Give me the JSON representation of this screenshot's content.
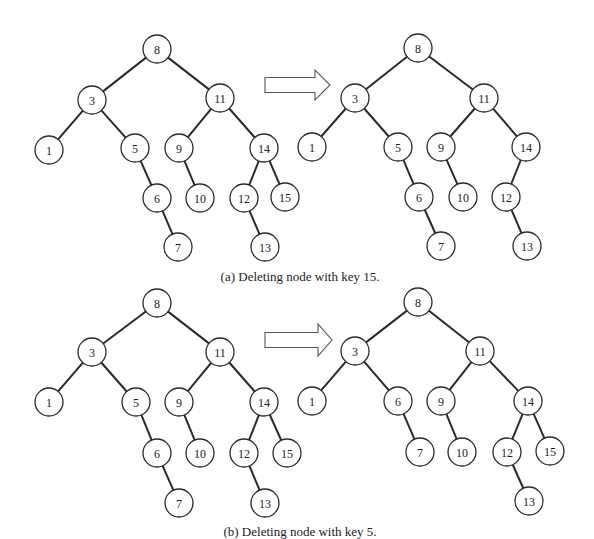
{
  "figure": {
    "node_radius": 14,
    "colors": {
      "stroke": "#2a2a2a",
      "fill": "#ffffff",
      "text": "#222222",
      "arrow_stroke": "#555555"
    },
    "panels": [
      {
        "id": "a",
        "caption": "(a) Deleting node with key 15.",
        "caption_pos": [
          300,
          278
        ],
        "deleted_key": 15,
        "arrow": {
          "x1": 265,
          "y_mid": 85,
          "shaft_half": 7.5,
          "head_start": 315,
          "head_half": 15,
          "tip": 330
        },
        "before": {
          "nodes": [
            {
              "key": "8",
              "x": 157,
              "y": 49
            },
            {
              "key": "3",
              "x": 92,
              "y": 100
            },
            {
              "key": "11",
              "x": 220,
              "y": 98
            },
            {
              "key": "1",
              "x": 49,
              "y": 150
            },
            {
              "key": "5",
              "x": 135,
              "y": 148
            },
            {
              "key": "9",
              "x": 179,
              "y": 148
            },
            {
              "key": "14",
              "x": 264,
              "y": 148
            },
            {
              "key": "6",
              "x": 157,
              "y": 198
            },
            {
              "key": "10",
              "x": 200,
              "y": 198
            },
            {
              "key": "12",
              "x": 244,
              "y": 198
            },
            {
              "key": "15",
              "x": 285,
              "y": 197
            },
            {
              "key": "7",
              "x": 178,
              "y": 247
            },
            {
              "key": "13",
              "x": 265,
              "y": 247
            }
          ],
          "edges": [
            [
              "8",
              "3"
            ],
            [
              "8",
              "11"
            ],
            [
              "3",
              "1"
            ],
            [
              "3",
              "5"
            ],
            [
              "5",
              "6"
            ],
            [
              "6",
              "7"
            ],
            [
              "11",
              "9"
            ],
            [
              "11",
              "14"
            ],
            [
              "9",
              "10"
            ],
            [
              "14",
              "12"
            ],
            [
              "14",
              "15"
            ],
            [
              "12",
              "13"
            ]
          ]
        },
        "after": {
          "nodes": [
            {
              "key": "8",
              "x": 418,
              "y": 48
            },
            {
              "key": "3",
              "x": 355,
              "y": 98
            },
            {
              "key": "11",
              "x": 484,
              "y": 98
            },
            {
              "key": "1",
              "x": 312,
              "y": 147
            },
            {
              "key": "5",
              "x": 398,
              "y": 147
            },
            {
              "key": "9",
              "x": 441,
              "y": 147
            },
            {
              "key": "14",
              "x": 526,
              "y": 147
            },
            {
              "key": "6",
              "x": 419,
              "y": 197
            },
            {
              "key": "10",
              "x": 463,
              "y": 197
            },
            {
              "key": "12",
              "x": 506,
              "y": 197
            },
            {
              "key": "7",
              "x": 441,
              "y": 246
            },
            {
              "key": "13",
              "x": 527,
              "y": 246
            }
          ],
          "edges": [
            [
              "8",
              "3"
            ],
            [
              "8",
              "11"
            ],
            [
              "3",
              "1"
            ],
            [
              "3",
              "5"
            ],
            [
              "5",
              "6"
            ],
            [
              "6",
              "7"
            ],
            [
              "11",
              "9"
            ],
            [
              "11",
              "14"
            ],
            [
              "9",
              "10"
            ],
            [
              "14",
              "12"
            ],
            [
              "12",
              "13"
            ]
          ]
        }
      },
      {
        "id": "b",
        "caption": "(b) Deleting node with key 5.",
        "caption_pos": [
          300,
          533
        ],
        "deleted_key": 5,
        "arrow": {
          "x1": 265,
          "y_mid": 340,
          "shaft_half": 7.5,
          "head_start": 318,
          "head_half": 16,
          "tip": 332
        },
        "before": {
          "nodes": [
            {
              "key": "8",
              "x": 157,
              "y": 303
            },
            {
              "key": "3",
              "x": 92,
              "y": 352
            },
            {
              "key": "11",
              "x": 220,
              "y": 352
            },
            {
              "key": "1",
              "x": 49,
              "y": 402
            },
            {
              "key": "5",
              "x": 136,
              "y": 402
            },
            {
              "key": "9",
              "x": 179,
              "y": 402
            },
            {
              "key": "14",
              "x": 264,
              "y": 402
            },
            {
              "key": "6",
              "x": 157,
              "y": 453
            },
            {
              "key": "10",
              "x": 200,
              "y": 453
            },
            {
              "key": "12",
              "x": 244,
              "y": 453
            },
            {
              "key": "15",
              "x": 287,
              "y": 453
            },
            {
              "key": "7",
              "x": 179,
              "y": 503
            },
            {
              "key": "13",
              "x": 265,
              "y": 503
            }
          ],
          "edges": [
            [
              "8",
              "3"
            ],
            [
              "8",
              "11"
            ],
            [
              "3",
              "1"
            ],
            [
              "3",
              "5"
            ],
            [
              "5",
              "6"
            ],
            [
              "6",
              "7"
            ],
            [
              "11",
              "9"
            ],
            [
              "11",
              "14"
            ],
            [
              "9",
              "10"
            ],
            [
              "14",
              "12"
            ],
            [
              "14",
              "15"
            ],
            [
              "12",
              "13"
            ]
          ]
        },
        "after": {
          "nodes": [
            {
              "key": "8",
              "x": 418,
              "y": 302
            },
            {
              "key": "3",
              "x": 355,
              "y": 351
            },
            {
              "key": "11",
              "x": 480,
              "y": 351
            },
            {
              "key": "1",
              "x": 312,
              "y": 401
            },
            {
              "key": "6",
              "x": 398,
              "y": 401
            },
            {
              "key": "9",
              "x": 441,
              "y": 401
            },
            {
              "key": "14",
              "x": 528,
              "y": 401
            },
            {
              "key": "7",
              "x": 420,
              "y": 452
            },
            {
              "key": "10",
              "x": 462,
              "y": 452
            },
            {
              "key": "12",
              "x": 507,
              "y": 452
            },
            {
              "key": "15",
              "x": 550,
              "y": 451
            },
            {
              "key": "13",
              "x": 529,
              "y": 501
            }
          ],
          "edges": [
            [
              "8",
              "3"
            ],
            [
              "8",
              "11"
            ],
            [
              "3",
              "1"
            ],
            [
              "3",
              "6"
            ],
            [
              "6",
              "7"
            ],
            [
              "11",
              "9"
            ],
            [
              "11",
              "14"
            ],
            [
              "9",
              "10"
            ],
            [
              "14",
              "12"
            ],
            [
              "14",
              "15"
            ],
            [
              "12",
              "13"
            ]
          ]
        }
      }
    ]
  }
}
